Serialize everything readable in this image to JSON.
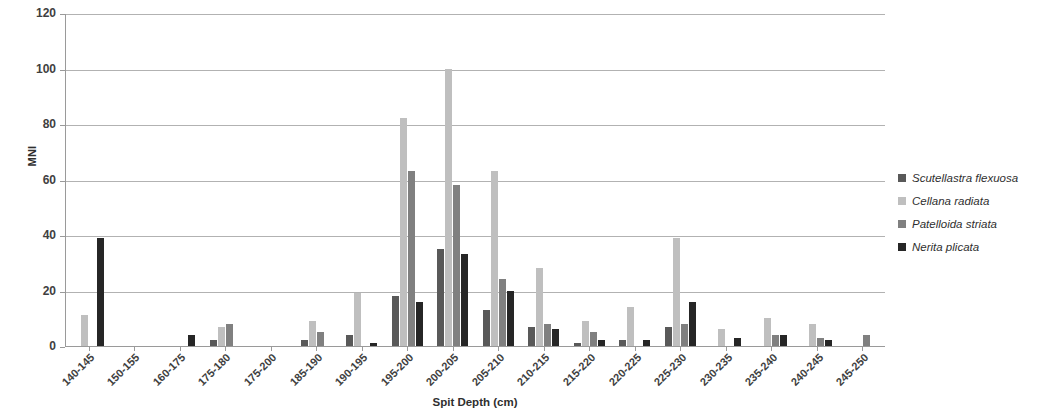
{
  "chart_data": {
    "type": "bar",
    "title": "",
    "xlabel": "Spit Depth (cm)",
    "ylabel": "MNI",
    "ylim": [
      0,
      120
    ],
    "ytick_step": 20,
    "yticks": [
      0,
      20,
      40,
      60,
      80,
      100,
      120
    ],
    "grid": true,
    "legend_position": "right",
    "categories": [
      "140-145",
      "150-155",
      "160-175",
      "175-180",
      "175-200",
      "185-190",
      "190-195",
      "195-200",
      "200-205",
      "205-210",
      "210-215",
      "215-220",
      "220-225",
      "225-230",
      "230-235",
      "235-240",
      "240-245",
      "245-250"
    ],
    "series": [
      {
        "name": "Scutellastra flexuosa",
        "color": "#595959",
        "values": [
          0,
          0,
          0,
          2,
          0,
          2,
          4,
          18,
          35,
          13,
          7,
          1,
          2,
          7,
          0,
          0,
          0,
          0
        ]
      },
      {
        "name": "Cellana radiata",
        "color": "#bfbfbf",
        "values": [
          11,
          0,
          0,
          7,
          0,
          9,
          19,
          82,
          100,
          63,
          28,
          9,
          14,
          39,
          6,
          10,
          8,
          0
        ]
      },
      {
        "name": "Patelloida striata",
        "color": "#808080",
        "values": [
          0,
          0,
          0,
          8,
          0,
          5,
          0,
          63,
          58,
          24,
          8,
          5,
          0,
          8,
          0,
          4,
          3,
          4
        ]
      },
      {
        "name": "Nerita plicata",
        "color": "#262626",
        "values": [
          39,
          0,
          4,
          0,
          0,
          0,
          1,
          16,
          33,
          20,
          6,
          2,
          2,
          16,
          3,
          4,
          2,
          0
        ]
      }
    ]
  }
}
